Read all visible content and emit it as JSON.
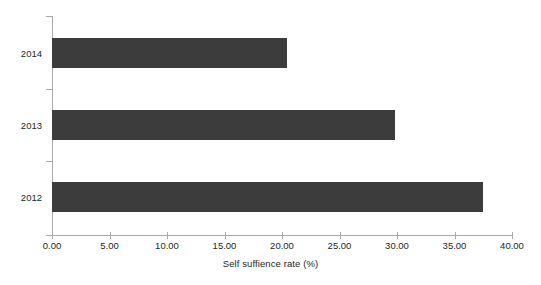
{
  "chart_data": {
    "type": "bar",
    "orientation": "horizontal",
    "title": "",
    "subtitle": "",
    "categories": [
      "2014",
      "2013",
      "2012"
    ],
    "values": [
      20.4,
      29.8,
      37.5
    ],
    "series": [
      {
        "name": "Self suffience rate",
        "values": [
          20.4,
          29.8,
          37.5
        ]
      }
    ],
    "xlabel": "Self suffience rate (%)",
    "ylabel": "",
    "xlim": [
      0,
      40
    ],
    "ylim": null,
    "xticks": [
      0,
      5,
      10,
      15,
      20,
      25,
      30,
      35,
      40
    ],
    "xticklabels": [
      "0.00",
      "5.00",
      "10.00",
      "15.00",
      "20.00",
      "25.00",
      "30.00",
      "35.00",
      "40.00"
    ],
    "yticklabels": [
      "2014",
      "2013",
      "2012"
    ],
    "grid": false,
    "legend": false,
    "legend_position": "none",
    "bar_color": "#3c3c3c",
    "axis_color": "#a7a9ac",
    "text_color": "#231f20",
    "background_color": "#ffffff",
    "annotations": []
  },
  "axis": {
    "x_title": "Self suffience rate (%)",
    "x_tick_labels": [
      "0.00",
      "5.00",
      "10.00",
      "15.00",
      "20.00",
      "25.00",
      "30.00",
      "35.00",
      "40.00"
    ],
    "y_tick_labels": [
      "2014",
      "2013",
      "2012"
    ]
  }
}
